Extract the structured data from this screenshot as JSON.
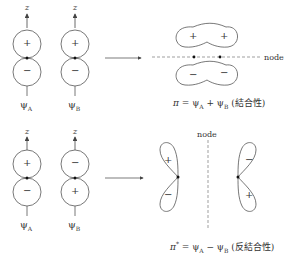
{
  "top": {
    "orbital_A": {
      "axis": "z",
      "upper_sign": "+",
      "lower_sign": "−",
      "label": "ψ",
      "label_sub": "A"
    },
    "orbital_B": {
      "axis": "z",
      "upper_sign": "+",
      "lower_sign": "−",
      "label": "ψ",
      "label_sub": "B"
    },
    "result": {
      "upper_signs": [
        "+",
        "+"
      ],
      "lower_signs": [
        "−",
        "−"
      ],
      "node_label": "node"
    },
    "formula": {
      "lhs": "π",
      "eq": " = ψ",
      "sub1": "A",
      "op": " + ψ",
      "sub2": "B",
      "note": " (結合性)"
    }
  },
  "bottom": {
    "orbital_A": {
      "axis": "z",
      "upper_sign": "+",
      "lower_sign": "−",
      "label": "ψ",
      "label_sub": "A"
    },
    "orbital_B": {
      "axis": "z",
      "upper_sign": "−",
      "lower_sign": "+",
      "label": "ψ",
      "label_sub": "B"
    },
    "result": {
      "left_signs": [
        "+",
        "−"
      ],
      "right_signs": [
        "−",
        "+"
      ],
      "node_label": "node"
    },
    "formula": {
      "lhs": "π",
      "star": "*",
      "eq": " = ψ",
      "sub1": "A",
      "op": " − ψ",
      "sub2": "B",
      "note": " (反結合性)"
    }
  },
  "colors": {
    "line": "#555555",
    "text": "#333333",
    "dash": "#777777"
  }
}
